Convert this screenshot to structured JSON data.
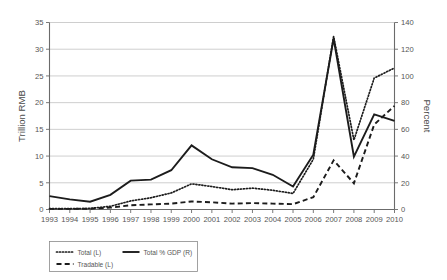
{
  "chart_data": {
    "type": "line",
    "title": "",
    "subtitle": "",
    "xlabel": "",
    "ylabel": "Trillion RMB",
    "y2label": "Percent",
    "grid": true,
    "legend_position": "below-left",
    "categories": [
      "1993",
      "1994",
      "1995",
      "1996",
      "1997",
      "1998",
      "1999",
      "2000",
      "2001",
      "2002",
      "2003",
      "2004",
      "2005",
      "2006",
      "2007",
      "2008",
      "2009",
      "2010"
    ],
    "x": [
      1993,
      1994,
      1995,
      1996,
      1997,
      1998,
      1999,
      2000,
      2001,
      2002,
      2003,
      2004,
      2005,
      2006,
      2007,
      2008,
      2009,
      2010
    ],
    "ylim": [
      0,
      35
    ],
    "yticks": [
      0,
      5,
      10,
      15,
      20,
      25,
      30,
      35
    ],
    "y2lim": [
      0,
      140
    ],
    "y2ticks": [
      0,
      20,
      40,
      60,
      80,
      100,
      120,
      140
    ],
    "series": [
      {
        "name": "Total (L)",
        "axis": "left",
        "style": "dotted",
        "color": "#1c1c1c",
        "values": [
          0.15,
          0.15,
          0.2,
          0.6,
          1.6,
          2.2,
          3.1,
          4.8,
          4.3,
          3.7,
          4.0,
          3.6,
          3.0,
          9.4,
          32.4,
          13.0,
          24.6,
          26.5
        ]
      },
      {
        "name": "Total % GDP (R)",
        "axis": "right",
        "style": "solid",
        "color": "#1c1c1c",
        "values": [
          10.0,
          7.6,
          5.8,
          11.0,
          21.6,
          22.4,
          29.4,
          48.0,
          37.6,
          31.6,
          31.0,
          26.0,
          17.2,
          41.0,
          128.0,
          39.6,
          71.2,
          66.4
        ]
      },
      {
        "name": "Tradable (L)",
        "axis": "left",
        "style": "dashed",
        "color": "#1c1c1c",
        "values": [
          0.12,
          0.12,
          0.15,
          0.35,
          0.8,
          0.95,
          1.1,
          1.5,
          1.35,
          1.1,
          1.2,
          1.1,
          1.0,
          2.3,
          9.2,
          4.9,
          15.9,
          19.4
        ]
      }
    ],
    "legend": [
      {
        "label": "Total (L)",
        "style": "dotted"
      },
      {
        "label": "Total % GDP (R)",
        "style": "solid"
      },
      {
        "label": "Tradable (L)",
        "style": "dashed"
      }
    ]
  }
}
